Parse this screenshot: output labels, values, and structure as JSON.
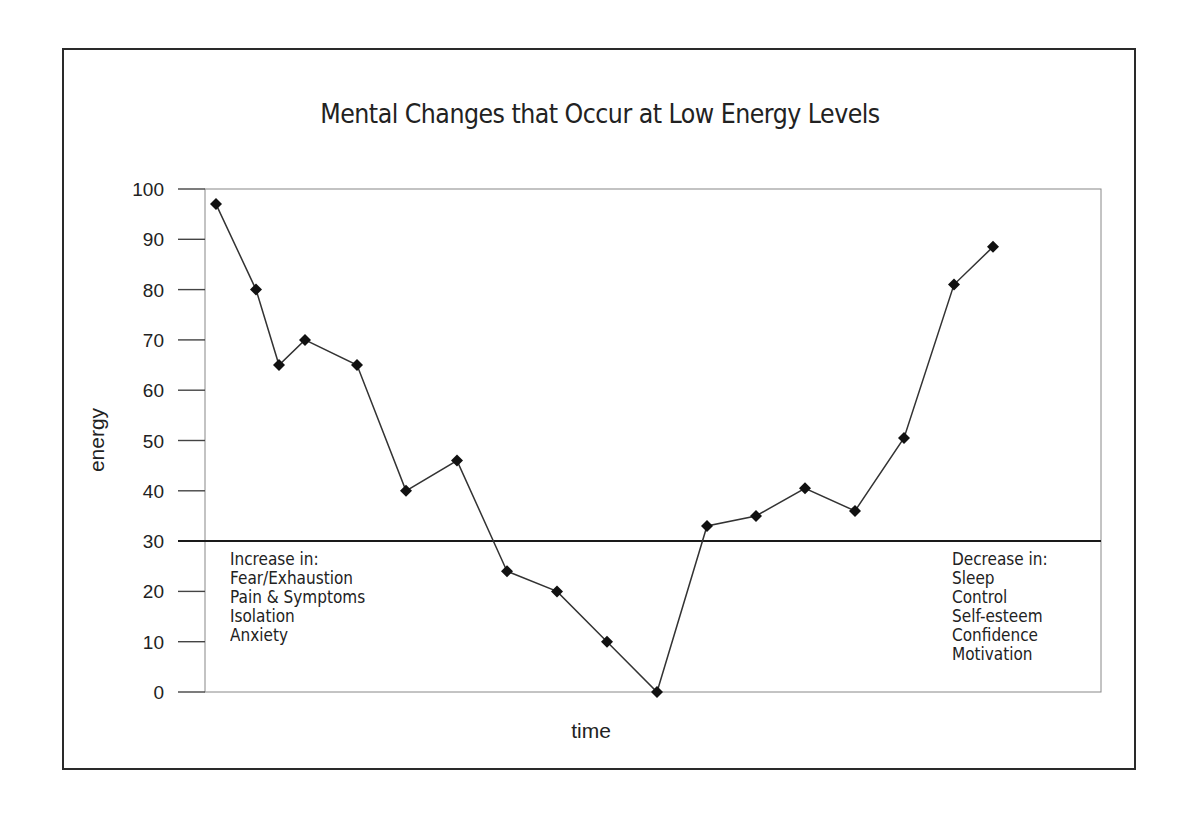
{
  "chart_data": {
    "type": "line",
    "title": "Mental Changes that Occur at Low Energy Levels",
    "xlabel": "time",
    "ylabel": "energy",
    "ylim": [
      0,
      100
    ],
    "yticks": [
      0,
      10,
      20,
      30,
      40,
      50,
      60,
      70,
      80,
      90,
      100
    ],
    "grid": false,
    "legend": null,
    "x": [
      1,
      2,
      3,
      4,
      5,
      6,
      7,
      8,
      9,
      10,
      11,
      12,
      13,
      14,
      15,
      16,
      17,
      18
    ],
    "series": [
      {
        "name": "energy",
        "marker": "diamond",
        "values": [
          97,
          80,
          65,
          70,
          65,
          40,
          46,
          24,
          20,
          10,
          0,
          33,
          35,
          40.5,
          36,
          50.5,
          81,
          88.5
        ]
      }
    ],
    "reference_line": {
      "y": 30,
      "style": "solid"
    },
    "annotations": [
      {
        "position": "lower-left",
        "heading": "Increase in:",
        "items": [
          "Fear/Exhaustion",
          "Pain & Symptoms",
          "Isolation",
          "Anxiety"
        ]
      },
      {
        "position": "lower-right",
        "heading": "Decrease in:",
        "items": [
          "Sleep",
          "Control",
          "Self-esteem",
          "Confidence",
          "Motivation"
        ]
      }
    ]
  },
  "colors": {
    "line": "#333333",
    "marker": "#111111",
    "frame": "#2a2a2a",
    "axis": "#888888"
  }
}
